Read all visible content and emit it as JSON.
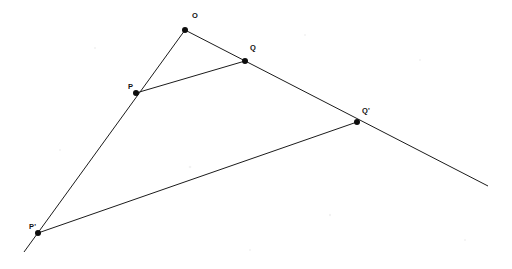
{
  "figure": {
    "background_color": "#ffffff",
    "line_color": "#1b1b1b",
    "point_color": "#0d0d0d",
    "label_color": "#121212",
    "width": 512,
    "height": 269
  },
  "chart_data": {
    "type": "scatter",
    "title": "",
    "xlabel": "",
    "ylabel": "",
    "xlim": [
      0,
      512
    ],
    "ylim": [
      0,
      269
    ],
    "grid": false,
    "legend": "none",
    "points": [
      {
        "name": "O",
        "label": "O",
        "x": 185,
        "y": 30,
        "label_x": 192,
        "label_y": 18,
        "radius": 3.0
      },
      {
        "name": "Q",
        "label": "Q",
        "x": 245,
        "y": 61,
        "label_x": 250,
        "label_y": 50,
        "radius": 3.0
      },
      {
        "name": "P",
        "label": "P",
        "x": 136,
        "y": 93,
        "label_x": 128,
        "label_y": 89,
        "radius": 3.0
      },
      {
        "name": "Qp",
        "label": "Q'",
        "x": 357,
        "y": 122,
        "label_x": 362,
        "label_y": 113,
        "radius": 3.0
      },
      {
        "name": "Pp",
        "label": "P'",
        "x": 38,
        "y": 233,
        "label_x": 29,
        "label_y": 229,
        "radius": 3.0
      }
    ],
    "lines": [
      {
        "name": "ray-O-P-Pprime",
        "from": "O",
        "to": "P-prime-extended",
        "x1": 185,
        "y1": 30,
        "x2": 24,
        "y2": 252
      },
      {
        "name": "ray-O-Q-Qprime",
        "from": "O",
        "to": "Q-prime-extended",
        "x1": 185,
        "y1": 30,
        "x2": 488,
        "y2": 186
      },
      {
        "name": "segment-P-Q",
        "from": "P",
        "to": "Q",
        "x1": 136,
        "y1": 93,
        "x2": 245,
        "y2": 61
      },
      {
        "name": "segment-Pp-Qp",
        "from": "P'",
        "to": "Q'",
        "x1": 38,
        "y1": 233,
        "x2": 357,
        "y2": 122
      }
    ]
  }
}
